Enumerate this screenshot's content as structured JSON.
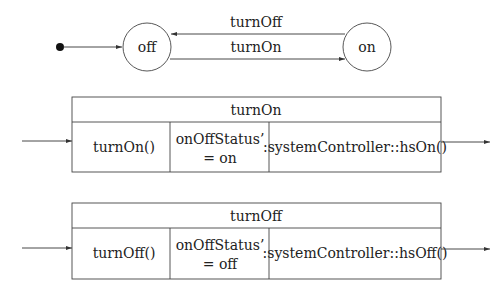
{
  "state_machine": {
    "states": [
      {
        "id": "off",
        "label": "off"
      },
      {
        "id": "on",
        "label": "on"
      }
    ],
    "transitions": [
      {
        "from": "on",
        "to": "off",
        "label": "turnOff"
      },
      {
        "from": "off",
        "to": "on",
        "label": "turnOn"
      }
    ],
    "initial": "off"
  },
  "operations": [
    {
      "title": "turnOn",
      "trigger": "turnOn()",
      "postcondition_line1": "onOffStatus’",
      "postcondition_line2": "= on",
      "action": ":systemController::hsOn()"
    },
    {
      "title": "turnOff",
      "trigger": "turnOff()",
      "postcondition_line1": "onOffStatus’",
      "postcondition_line2": "= off",
      "action": ":systemController::hsOff()"
    }
  ],
  "colors": {
    "stroke": "#333333",
    "background": "#ffffff"
  }
}
